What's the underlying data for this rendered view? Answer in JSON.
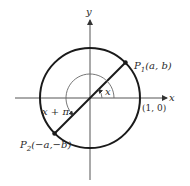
{
  "diagram": {
    "axes": {
      "x_label": "x",
      "y_label": "y"
    },
    "circle": {
      "intercept_label": "(1, 0)"
    },
    "points": [
      {
        "id": "P1",
        "label_main": "P",
        "label_sub": "1",
        "label_coords": "(a, b)"
      },
      {
        "id": "P2",
        "label_main": "P",
        "label_sub": "2",
        "label_coords": "(−a,−b)"
      }
    ],
    "angles": [
      {
        "id": "small",
        "label": "x"
      },
      {
        "id": "large",
        "label": "x + π"
      }
    ],
    "colors": {
      "stroke": "#1a1a1a",
      "axis": "#555555",
      "thin_arc": "#666666"
    }
  }
}
